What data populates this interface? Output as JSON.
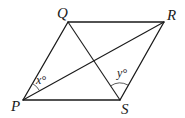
{
  "diagram": {
    "type": "parallelogram-with-diagonals",
    "vertices": {
      "P": {
        "label": "P",
        "x": 23,
        "y": 100
      },
      "Q": {
        "label": "Q",
        "x": 68,
        "y": 22
      },
      "R": {
        "label": "R",
        "x": 164,
        "y": 22
      },
      "S": {
        "label": "S",
        "x": 120,
        "y": 100
      }
    },
    "sides": [
      "PQ",
      "QR",
      "RS",
      "SP"
    ],
    "diagonals": [
      "PR",
      "QS"
    ],
    "angles": [
      {
        "vertex": "P",
        "between": [
          "PQ",
          "PR"
        ],
        "label": "x°"
      },
      {
        "vertex": "S",
        "between": [
          "SQ",
          "SR"
        ],
        "label": "y°"
      }
    ],
    "colors": {
      "stroke": "#1a1a1a",
      "background": "#ffffff"
    }
  }
}
